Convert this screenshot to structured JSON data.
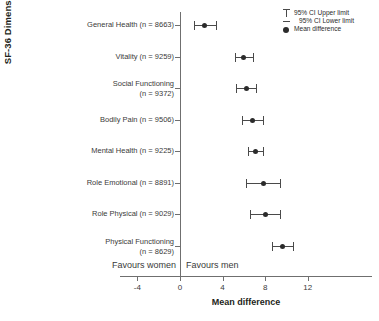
{
  "chart_data": {
    "type": "scatter",
    "title": "",
    "xlabel": "Mean difference",
    "ylabel": "SF-36 Dimension",
    "xlim": [
      -5.6,
      12.9
    ],
    "xticks": [
      -4,
      0,
      4,
      8,
      12
    ],
    "xtick_labels": [
      "-4",
      "0",
      "4",
      "8",
      "12"
    ],
    "grid": false,
    "zero_reference_line": 0,
    "annotations": {
      "left": "Favours women",
      "right": "Favours men"
    },
    "legend": {
      "position": "top-right",
      "entries": [
        "95% CI Upper limit",
        "95% CI Lower limit",
        "Mean difference"
      ]
    },
    "categories": [
      "General Health (n = 8663)",
      "Vitality (n = 9259)",
      "Social Functioning\n(n = 9372)",
      "Bodily Pain (n = 9506)",
      "Mental Health (n = 9225)",
      "Role Emotional (n = 8891)",
      "Role Physical (n = 9029)",
      "Physical Functioning\n(n = 8629)"
    ],
    "points": [
      {
        "label": "General Health (n = 8663)",
        "mean": 2.3,
        "ci_low": 1.3,
        "ci_high": 3.4
      },
      {
        "label": "Vitality (n = 9259)",
        "mean": 6.0,
        "ci_low": 5.2,
        "ci_high": 6.9
      },
      {
        "label": "Social Functioning (n = 9372)",
        "mean": 6.2,
        "ci_low": 5.3,
        "ci_high": 7.1
      },
      {
        "label": "Bodily Pain (n = 9506)",
        "mean": 6.8,
        "ci_low": 5.8,
        "ci_high": 7.8
      },
      {
        "label": "Mental Health (n = 9225)",
        "mean": 7.1,
        "ci_low": 6.4,
        "ci_high": 7.8
      },
      {
        "label": "Role Emotional (n = 8891)",
        "mean": 7.8,
        "ci_low": 6.2,
        "ci_high": 9.4
      },
      {
        "label": "Role Physical (n = 9029)",
        "mean": 8.0,
        "ci_low": 6.6,
        "ci_high": 9.4
      },
      {
        "label": "Physical Functioning (n = 8629)",
        "mean": 9.6,
        "ci_low": 8.6,
        "ci_high": 10.6
      }
    ]
  }
}
